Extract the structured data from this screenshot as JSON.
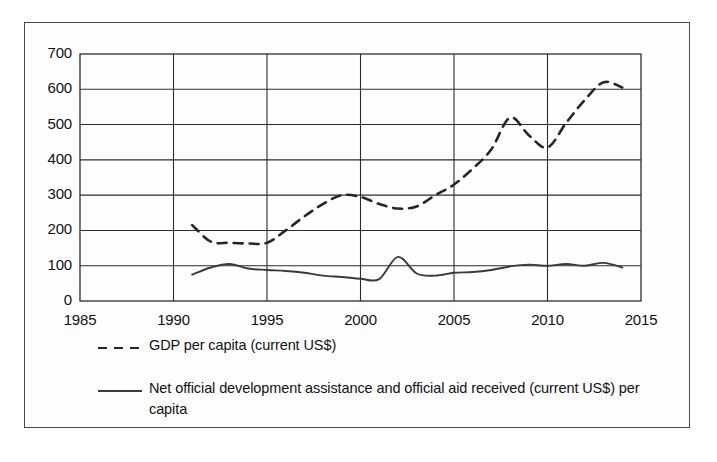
{
  "chart_data": {
    "type": "line",
    "title": "",
    "xlabel": "",
    "ylabel": "",
    "xlim": [
      1985,
      2015
    ],
    "ylim": [
      0,
      700
    ],
    "xticks": [
      1985,
      1990,
      1995,
      2000,
      2005,
      2010,
      2015
    ],
    "yticks": [
      0,
      100,
      200,
      300,
      400,
      500,
      600,
      700
    ],
    "grid": true,
    "legend_position": "below",
    "series": [
      {
        "name": "GDP per capita (current US$)",
        "style": "dashed",
        "color": "#262626",
        "x": [
          1991,
          1992,
          1993,
          1994,
          1995,
          1996,
          1997,
          1998,
          1999,
          2000,
          2001,
          2002,
          2003,
          2004,
          2005,
          2006,
          2007,
          2008,
          2009,
          2010,
          2011,
          2012,
          2013,
          2014
        ],
        "values": [
          215,
          168,
          165,
          163,
          165,
          200,
          240,
          275,
          300,
          295,
          275,
          262,
          268,
          300,
          330,
          375,
          430,
          520,
          470,
          435,
          505,
          570,
          620,
          605
        ]
      },
      {
        "name": "Net official development assistance and official aid received (current US$)  per capita",
        "style": "solid",
        "color": "#3a3a3a",
        "x": [
          1991,
          1992,
          1993,
          1994,
          1995,
          1996,
          1997,
          1998,
          1999,
          2000,
          2001,
          2002,
          2003,
          2004,
          2005,
          2006,
          2007,
          2008,
          2009,
          2010,
          2011,
          2012,
          2013,
          2014
        ],
        "values": [
          75,
          95,
          105,
          92,
          88,
          85,
          80,
          72,
          68,
          63,
          62,
          125,
          78,
          72,
          80,
          82,
          88,
          98,
          103,
          100,
          105,
          100,
          108,
          95
        ]
      }
    ]
  },
  "legend": {
    "entries": [
      {
        "label": "GDP per capita (current US$)",
        "marker": "dashed-line-marker"
      },
      {
        "label": "Net official development assistance and official aid received (current US$)  per capita",
        "marker": "solid-line-marker"
      }
    ]
  }
}
